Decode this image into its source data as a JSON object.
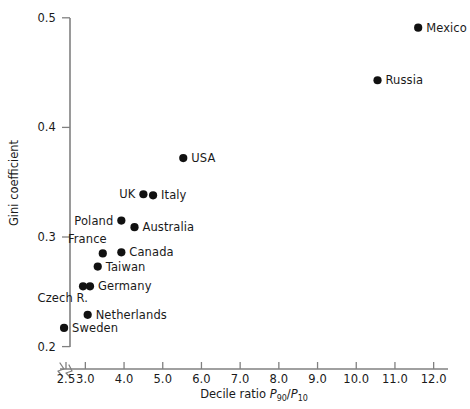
{
  "chart_data": {
    "type": "scatter",
    "title": "",
    "xlabel": "Decile ratio P90/P10",
    "xlabel_parts": {
      "prefix": "Decile ratio ",
      "num_var": "P",
      "num_sub": "90",
      "slash": "/",
      "den_var": "P",
      "den_sub": "10"
    },
    "ylabel": "Gini coefficient",
    "xlim": [
      2.3,
      12.0
    ],
    "ylim": [
      0.2,
      0.5
    ],
    "xticks": [
      2.5,
      3.0,
      4.0,
      5.0,
      6.0,
      7.0,
      8.0,
      9.0,
      10.0,
      11.0,
      12.0
    ],
    "xticklabels": [
      "2.5",
      "3.0",
      "4.0",
      "5.0",
      "6.0",
      "7.0",
      "8.0",
      "9.0",
      "10.0",
      "11.0",
      "12.0"
    ],
    "yticks": [
      0.2,
      0.3,
      0.4,
      0.5
    ],
    "yticklabels": [
      "0.2",
      "0.3",
      "0.4",
      "0.5"
    ],
    "grid": false,
    "legend": "none",
    "axis_break": {
      "axis": "x",
      "style": "zigzag",
      "note": "break between origin and 2.5"
    },
    "marker_color": "#111111",
    "axis_color": "#808080",
    "points": [
      {
        "label": "Mexico",
        "x": 11.6,
        "y": 0.491,
        "label_side": "right"
      },
      {
        "label": "Russia",
        "x": 10.55,
        "y": 0.443,
        "label_side": "right"
      },
      {
        "label": "USA",
        "x": 5.53,
        "y": 0.372,
        "label_side": "right"
      },
      {
        "label": "UK",
        "x": 4.5,
        "y": 0.339,
        "label_side": "left"
      },
      {
        "label": "Italy",
        "x": 4.75,
        "y": 0.338,
        "label_side": "right"
      },
      {
        "label": "Poland",
        "x": 3.93,
        "y": 0.315,
        "label_side": "left"
      },
      {
        "label": "Australia",
        "x": 4.27,
        "y": 0.309,
        "label_side": "right"
      },
      {
        "label": "France",
        "x": 3.45,
        "y": 0.285,
        "label_side": "above-left"
      },
      {
        "label": "Canada",
        "x": 3.93,
        "y": 0.286,
        "label_side": "right"
      },
      {
        "label": "Taiwan",
        "x": 3.32,
        "y": 0.273,
        "label_side": "right"
      },
      {
        "label": "Germany",
        "x": 3.12,
        "y": 0.255,
        "label_side": "right"
      },
      {
        "label": "Czech R.",
        "x": 2.94,
        "y": 0.255,
        "label_side": "below-left"
      },
      {
        "label": "Netherlands",
        "x": 3.06,
        "y": 0.229,
        "label_side": "right"
      },
      {
        "label": "Sweden",
        "x": 2.45,
        "y": 0.217,
        "label_side": "right"
      }
    ]
  }
}
